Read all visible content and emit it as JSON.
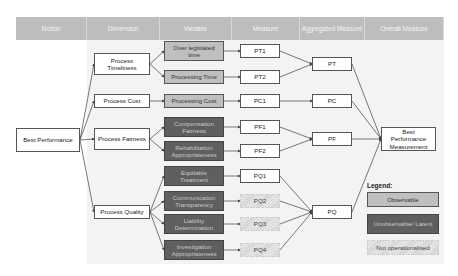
{
  "headers": [
    "Notion",
    "Dimension",
    "Variable",
    "Measure",
    "Aggregated Measure",
    "Overall Measure"
  ],
  "notion": {
    "label": "Best Performance"
  },
  "dimensions": [
    {
      "label": "Process Timeliness"
    },
    {
      "label": "Process Cost"
    },
    {
      "label": "Process Fairness"
    },
    {
      "label": "Process Quality"
    }
  ],
  "variables": [
    {
      "label": "Over legislated time",
      "type": "observable"
    },
    {
      "label": "Processing Time",
      "type": "observable"
    },
    {
      "label": "Processing Cost",
      "type": "observable"
    },
    {
      "label": "Compensation Fairness",
      "type": "latent"
    },
    {
      "label": "Rehabilitation Appropriateness",
      "type": "latent"
    },
    {
      "label": "Equitable Treatment",
      "type": "latent"
    },
    {
      "label": "Communication Transparency",
      "type": "latent"
    },
    {
      "label": "Liability Determination",
      "type": "latent"
    },
    {
      "label": "Investigation Appropriateness",
      "type": "latent"
    }
  ],
  "measures": [
    {
      "label": "PT1",
      "type": "operationalised"
    },
    {
      "label": "PT2",
      "type": "operationalised"
    },
    {
      "label": "PC1",
      "type": "operationalised"
    },
    {
      "label": "PF1",
      "type": "operationalised"
    },
    {
      "label": "PF2",
      "type": "operationalised"
    },
    {
      "label": "PQ1",
      "type": "operationalised"
    },
    {
      "label": "PQ2",
      "type": "not_operationalised"
    },
    {
      "label": "PQ3",
      "type": "not_operationalised"
    },
    {
      "label": "PQ4",
      "type": "not_operationalised"
    }
  ],
  "aggregated": [
    {
      "label": "PT"
    },
    {
      "label": "PC"
    },
    {
      "label": "PF"
    },
    {
      "label": "PQ"
    }
  ],
  "overall": {
    "label": "Best Performance Measurement"
  },
  "legend": {
    "title": "Legend:",
    "items": [
      {
        "label": "Observable",
        "color": "#bfbfbf"
      },
      {
        "label": "Unobservable/ Latent",
        "color": "#5f5f5f"
      },
      {
        "label": "Not operationalised",
        "color": "hatched"
      }
    ]
  },
  "colors": {
    "header": "#bdbdbd",
    "observable": "#bfbfbf",
    "latent": "#5f5f5f",
    "line": "#555555"
  }
}
